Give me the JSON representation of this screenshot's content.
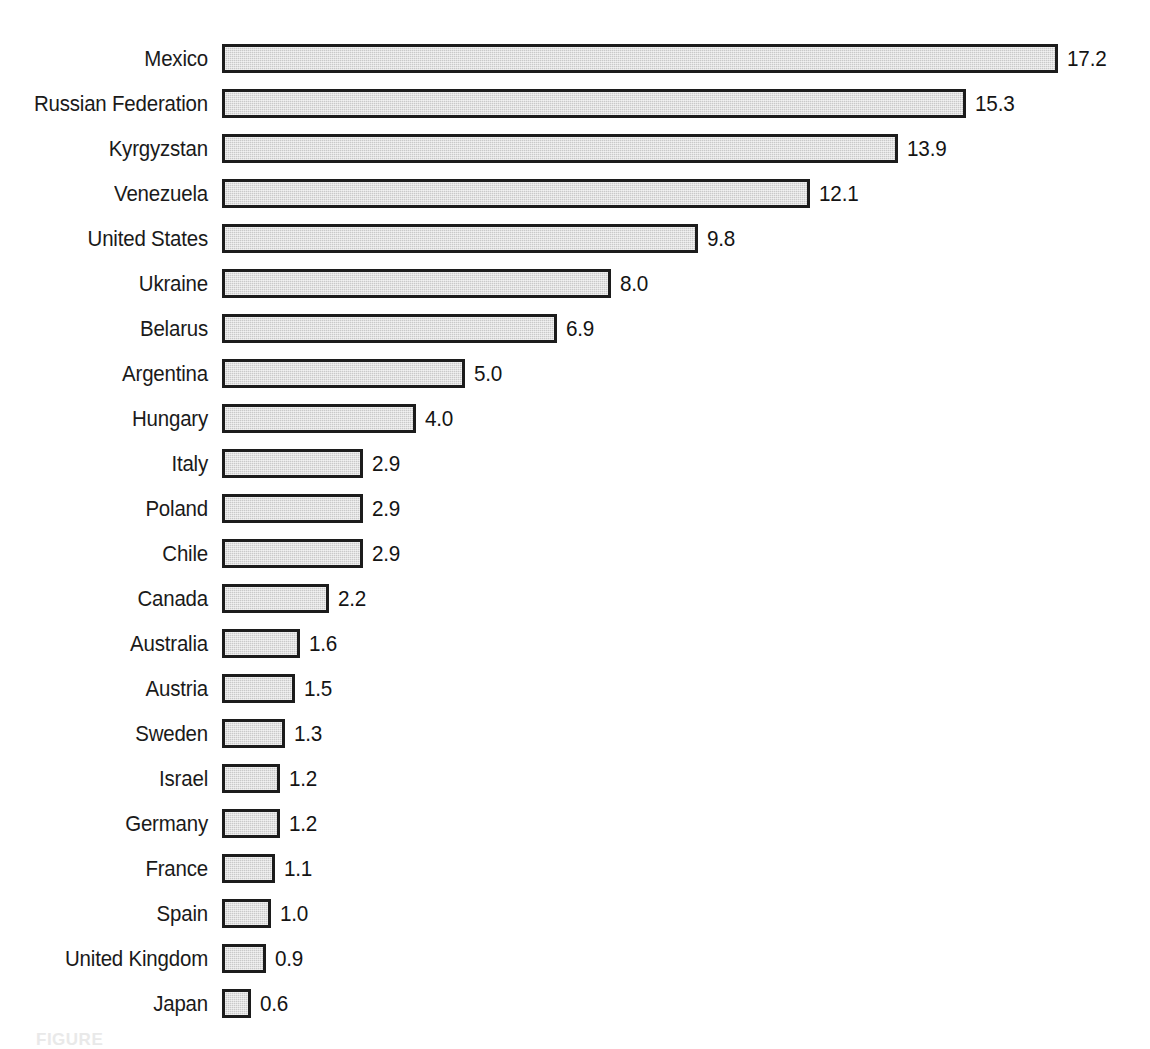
{
  "chart_data": {
    "type": "bar",
    "orientation": "horizontal",
    "title": "",
    "xlabel": "",
    "ylabel": "",
    "xlim": [
      0,
      17.2
    ],
    "grid": false,
    "legend": null,
    "value_label_format": "one-decimal",
    "categories": [
      "Mexico",
      "Russian Federation",
      "Kyrgyzstan",
      "Venezuela",
      "United States",
      "Ukraine",
      "Belarus",
      "Argentina",
      "Hungary",
      "Italy",
      "Poland",
      "Chile",
      "Canada",
      "Australia",
      "Austria",
      "Sweden",
      "Israel",
      "Germany",
      "France",
      "Spain",
      "United Kingdom",
      "Japan"
    ],
    "values": [
      17.2,
      15.3,
      13.9,
      12.1,
      9.8,
      8.0,
      6.9,
      5.0,
      4.0,
      2.9,
      2.9,
      2.9,
      2.2,
      1.6,
      1.5,
      1.3,
      1.2,
      1.2,
      1.1,
      1.0,
      0.9,
      0.6
    ],
    "value_labels": [
      "17.2",
      "15.3",
      "13.9",
      "12.1",
      "9.8",
      "8.0",
      "6.9",
      "5.0",
      "4.0",
      "2.9",
      "2.9",
      "2.9",
      "2.2",
      "1.6",
      "1.5",
      "1.3",
      "1.2",
      "1.2",
      "1.1",
      "1.0",
      "0.9",
      "0.6"
    ],
    "colors": {
      "bar_fill": "#c9c9c9",
      "bar_border": "#1c1c1c",
      "text": "#1a1a1a",
      "background": "#ffffff"
    }
  },
  "figure": {
    "caption": "FIGURE"
  }
}
